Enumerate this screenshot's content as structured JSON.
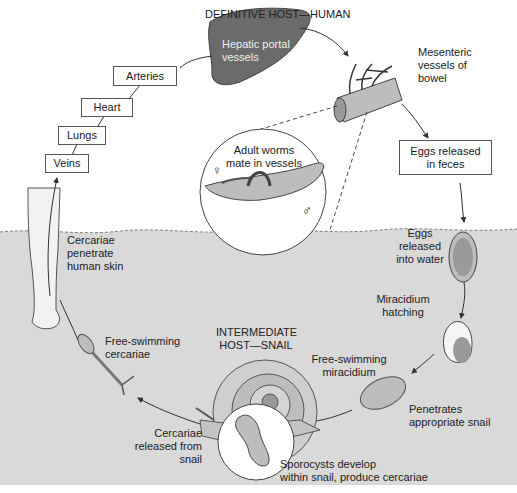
{
  "title": "DEFINITIVE HOST—HUMAN",
  "intermediate_host": "INTERMEDIATE\nHOST—SNAIL",
  "colors": {
    "water": "#d9d9d9",
    "liver": "#6b6b6b",
    "line": "#333333",
    "box_border": "#555555"
  },
  "circulation_boxes": [
    {
      "label": "Arteries"
    },
    {
      "label": "Heart"
    },
    {
      "label": "Lungs"
    },
    {
      "label": "Veins"
    }
  ],
  "stages": {
    "hepatic": "Hepatic portal\nvessels",
    "mesenteric": "Mesenteric\nvessels of\nbowel",
    "adult_worms": "Adult worms\nmate in vessels",
    "female_symbol": "♀",
    "male_symbol": "♂",
    "eggs_feces": "Eggs released\nin feces",
    "eggs_water": "Eggs\nreleased\ninto water",
    "miracidium_hatching": "Miracidium\nhatching",
    "free_miracidium": "Free-swimming\nmiracidium",
    "penetrates_snail": "Penetrates\nappropriate snail",
    "sporocysts": "Sporocysts develop\nwithin snail, produce cercariae",
    "cercariae_released": "Cercariae\nreleased from\nsnail",
    "free_cercariae": "Free-swimming\ncercariae",
    "cercariae_penetrate": "Cercariae\npenetrate\nhuman skin"
  }
}
